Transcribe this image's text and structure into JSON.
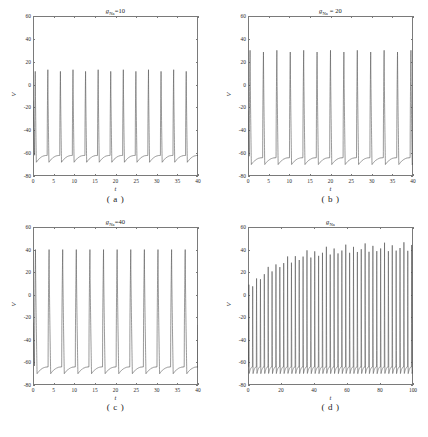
{
  "figure": {
    "background": "#ffffff",
    "line_color": "#555555",
    "axis_color": "#7a7a7a"
  },
  "chart_data": [
    {
      "type": "line",
      "panel_id": "a",
      "caption": "( a )",
      "title": "gₙₐ=10",
      "title_base": "g",
      "title_sub": "Na",
      "title_suffix": "=10",
      "xlabel": "t",
      "ylabel": "V",
      "xlim": [
        0,
        40
      ],
      "ylim": [
        -80,
        60
      ],
      "xticks": [
        0,
        5,
        10,
        15,
        20,
        25,
        30,
        35,
        40
      ],
      "xticklabels": [
        "0",
        "5",
        "10",
        "15",
        "20",
        "25",
        "30",
        "35",
        "40"
      ],
      "yticks": [
        -80,
        -60,
        -40,
        -20,
        0,
        20,
        40,
        60
      ],
      "yticklabels": [
        "-80",
        "-60",
        "-40",
        "-20",
        "0",
        "20",
        "40",
        "60"
      ],
      "grid": false,
      "legend": null,
      "series": [
        {
          "name": "V(t)",
          "waveform": "spike-train",
          "v_start": 5,
          "v_peak": 13,
          "v_trough": -68,
          "v_rest": -62,
          "period": 3.05,
          "first_peak_t": 0.55,
          "spike_width": 0.42,
          "n_spikes": 14,
          "envelope": "constant"
        }
      ]
    },
    {
      "type": "line",
      "panel_id": "b",
      "caption": "( b )",
      "title": "gₙₐ = 20",
      "title_base": "g",
      "title_sub": "Na",
      "title_suffix": " = 20",
      "xlabel": "t",
      "ylabel": "V",
      "xlim": [
        0,
        40
      ],
      "ylim": [
        -80,
        60
      ],
      "xticks": [
        0,
        5,
        10,
        15,
        20,
        25,
        30,
        35,
        40
      ],
      "xticklabels": [
        "0",
        "5",
        "10",
        "15",
        "20",
        "25",
        "30",
        "35",
        "40"
      ],
      "yticks": [
        -80,
        -60,
        -40,
        -20,
        0,
        20,
        40,
        60
      ],
      "yticklabels": [
        "-80",
        "-60",
        "-40",
        "-20",
        "0",
        "20",
        "40",
        "60"
      ],
      "grid": false,
      "legend": null,
      "series": [
        {
          "name": "V(t)",
          "waveform": "spike-train",
          "v_start": 2,
          "v_peak": 30,
          "v_trough": -70,
          "v_rest": -64,
          "period": 3.25,
          "first_peak_t": 0.5,
          "spike_width": 0.5,
          "n_spikes": 13,
          "envelope": "constant"
        }
      ]
    },
    {
      "type": "line",
      "panel_id": "c",
      "caption": "( c )",
      "title": "gₙₐ=40",
      "title_base": "g",
      "title_sub": "Na",
      "title_suffix": "=40",
      "xlabel": "t",
      "ylabel": "V",
      "xlim": [
        0,
        40
      ],
      "ylim": [
        -80,
        60
      ],
      "xticks": [
        0,
        5,
        10,
        15,
        20,
        25,
        30,
        35,
        40
      ],
      "xticklabels": [
        "0",
        "5",
        "10",
        "15",
        "20",
        "25",
        "30",
        "35",
        "40"
      ],
      "yticks": [
        -80,
        -60,
        -40,
        -20,
        0,
        20,
        40,
        60
      ],
      "yticklabels": [
        "-80",
        "-60",
        "-40",
        "-20",
        "0",
        "20",
        "40",
        "60"
      ],
      "grid": false,
      "legend": null,
      "series": [
        {
          "name": "V(t)",
          "waveform": "spike-train",
          "v_start": 0,
          "v_peak": 40,
          "v_trough": -70,
          "v_rest": -64,
          "period": 3.3,
          "first_peak_t": 0.6,
          "spike_width": 0.62,
          "n_spikes": 13,
          "envelope": "constant"
        }
      ]
    },
    {
      "type": "line",
      "panel_id": "d",
      "caption": "( d )",
      "title": "gₙₐ",
      "title_base": "g",
      "title_sub": "Na",
      "title_suffix": "",
      "xlabel": "t",
      "ylabel": "V",
      "xlim": [
        0,
        100
      ],
      "ylim": [
        -80,
        60
      ],
      "xticks": [
        0,
        20,
        40,
        60,
        80,
        100
      ],
      "xticklabels": [
        "0",
        "20",
        "40",
        "60",
        "80",
        "100"
      ],
      "yticks": [
        -80,
        -60,
        -40,
        -20,
        0,
        20,
        40,
        60
      ],
      "yticklabels": [
        "-80",
        "-60",
        "-40",
        "-20",
        "0",
        "20",
        "40",
        "60"
      ],
      "grid": false,
      "legend": null,
      "series": [
        {
          "name": "V(t)",
          "waveform": "spike-train-growing",
          "v_start": 5,
          "v_peak_initial": 8,
          "v_peak_final": 47,
          "v_trough": -70,
          "v_rest": -64,
          "period": 2.35,
          "first_peak_t": 0.5,
          "spike_width": 0.36,
          "n_spikes": 43,
          "envelope": "saturating",
          "envelope_tau": 22
        }
      ]
    }
  ]
}
